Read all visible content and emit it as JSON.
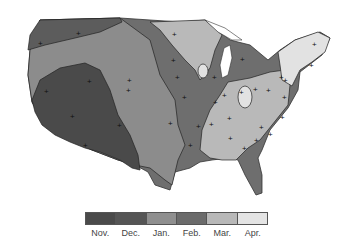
{
  "map": {
    "subject": "United States contour map by month",
    "zones": [
      {
        "month": "Nov.",
        "color": "#4a4a4a"
      },
      {
        "month": "Dec.",
        "color": "#5c5c5c"
      },
      {
        "month": "Jan.",
        "color": "#8c8c8c"
      },
      {
        "month": "Feb.",
        "color": "#6e6e6e"
      },
      {
        "month": "Mar.",
        "color": "#b9b9b9"
      },
      {
        "month": "Apr.",
        "color": "#e2e2e2"
      }
    ],
    "station_marker": "+",
    "station_count": 48
  },
  "legend": {
    "items": [
      {
        "label": "Nov.",
        "color": "#4a4a4a"
      },
      {
        "label": "Dec.",
        "color": "#555555"
      },
      {
        "label": "Jan.",
        "color": "#8f8f8f"
      },
      {
        "label": "Feb.",
        "color": "#6b6b6b"
      },
      {
        "label": "Mar.",
        "color": "#b8b8b8"
      },
      {
        "label": "Apr.",
        "color": "#e4e4e4"
      }
    ]
  }
}
